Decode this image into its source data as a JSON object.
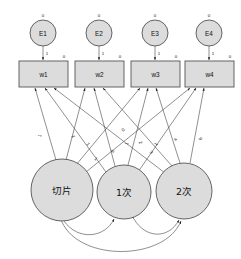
{
  "diagram": {
    "background_color": "#ffffff",
    "node_fill_color": "#dcdcdc",
    "node_stroke_color": "#555555",
    "edge_color": "#333333"
  },
  "errors": [
    {
      "id": "e1",
      "label": "E1",
      "variance_label": "0",
      "arrow_label": "1"
    },
    {
      "id": "e2",
      "label": "E2",
      "variance_label": "0",
      "arrow_label": "1"
    },
    {
      "id": "e3",
      "label": "E3",
      "variance_label": "0",
      "arrow_label": "1"
    },
    {
      "id": "e4",
      "label": "E4",
      "variance_label": "0",
      "arrow_label": "1"
    }
  ],
  "indicators": [
    {
      "id": "w1",
      "label": "w1",
      "corner_label": "0"
    },
    {
      "id": "w2",
      "label": "w2",
      "corner_label": "0"
    },
    {
      "id": "w3",
      "label": "w3",
      "corner_label": "0"
    },
    {
      "id": "w4",
      "label": "w4",
      "corner_label": "0"
    }
  ],
  "latents": [
    {
      "id": "intercept",
      "label": "切片"
    },
    {
      "id": "linear",
      "label": "1次"
    },
    {
      "id": "quadratic",
      "label": "2次"
    }
  ],
  "loadings": {
    "intercept": [
      "1",
      "1",
      "1",
      "1"
    ],
    "linear": [
      "0",
      "1",
      "2",
      "3"
    ],
    "quadratic": [
      "0",
      "1",
      "4",
      "9"
    ]
  },
  "covariances": [
    {
      "id": "cov-intercept-linear",
      "from": "intercept",
      "to": "linear"
    },
    {
      "id": "cov-linear-quadratic",
      "from": "linear",
      "to": "quadratic"
    },
    {
      "id": "cov-intercept-quadratic",
      "from": "intercept",
      "to": "quadratic"
    }
  ]
}
